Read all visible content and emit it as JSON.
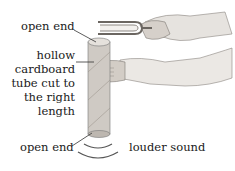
{
  "diagram": {
    "labels": {
      "open_end_top": "open end",
      "hollow_tube": [
        "hollow",
        "cardboard",
        "tube cut to",
        "the right",
        "length"
      ],
      "open_end_bottom": "open end",
      "louder_sound": "louder sound"
    },
    "colors": {
      "tube": "#cfcac4",
      "skin": "#d9d4ce",
      "sleeve": "#eeeeee",
      "line": "#333333"
    }
  }
}
